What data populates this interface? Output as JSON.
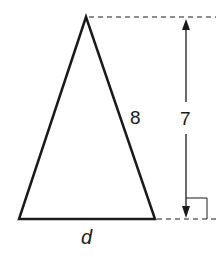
{
  "diagram": {
    "type": "isosceles-triangle",
    "labels": {
      "side": "8",
      "height": "7",
      "base": "d"
    },
    "colors": {
      "stroke": "#1a1a1a",
      "background": "#ffffff"
    }
  }
}
